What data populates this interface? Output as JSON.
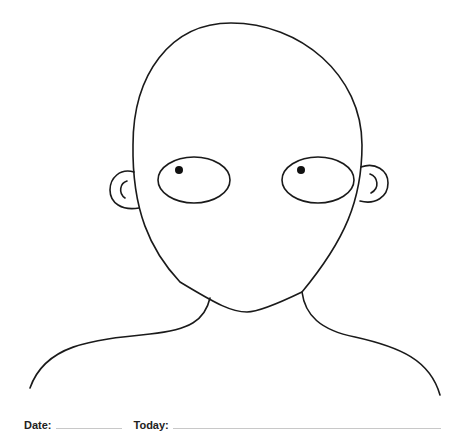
{
  "worksheet": {
    "figure": "blank face template with head, ears, eyes and shoulders",
    "footer": {
      "date_label": "Date:",
      "date_value": "",
      "today_label": "Today:",
      "today_value": ""
    }
  },
  "colors": {
    "line": "#1a1a1a",
    "background": "#ffffff",
    "underline": "#c8c8c8"
  }
}
